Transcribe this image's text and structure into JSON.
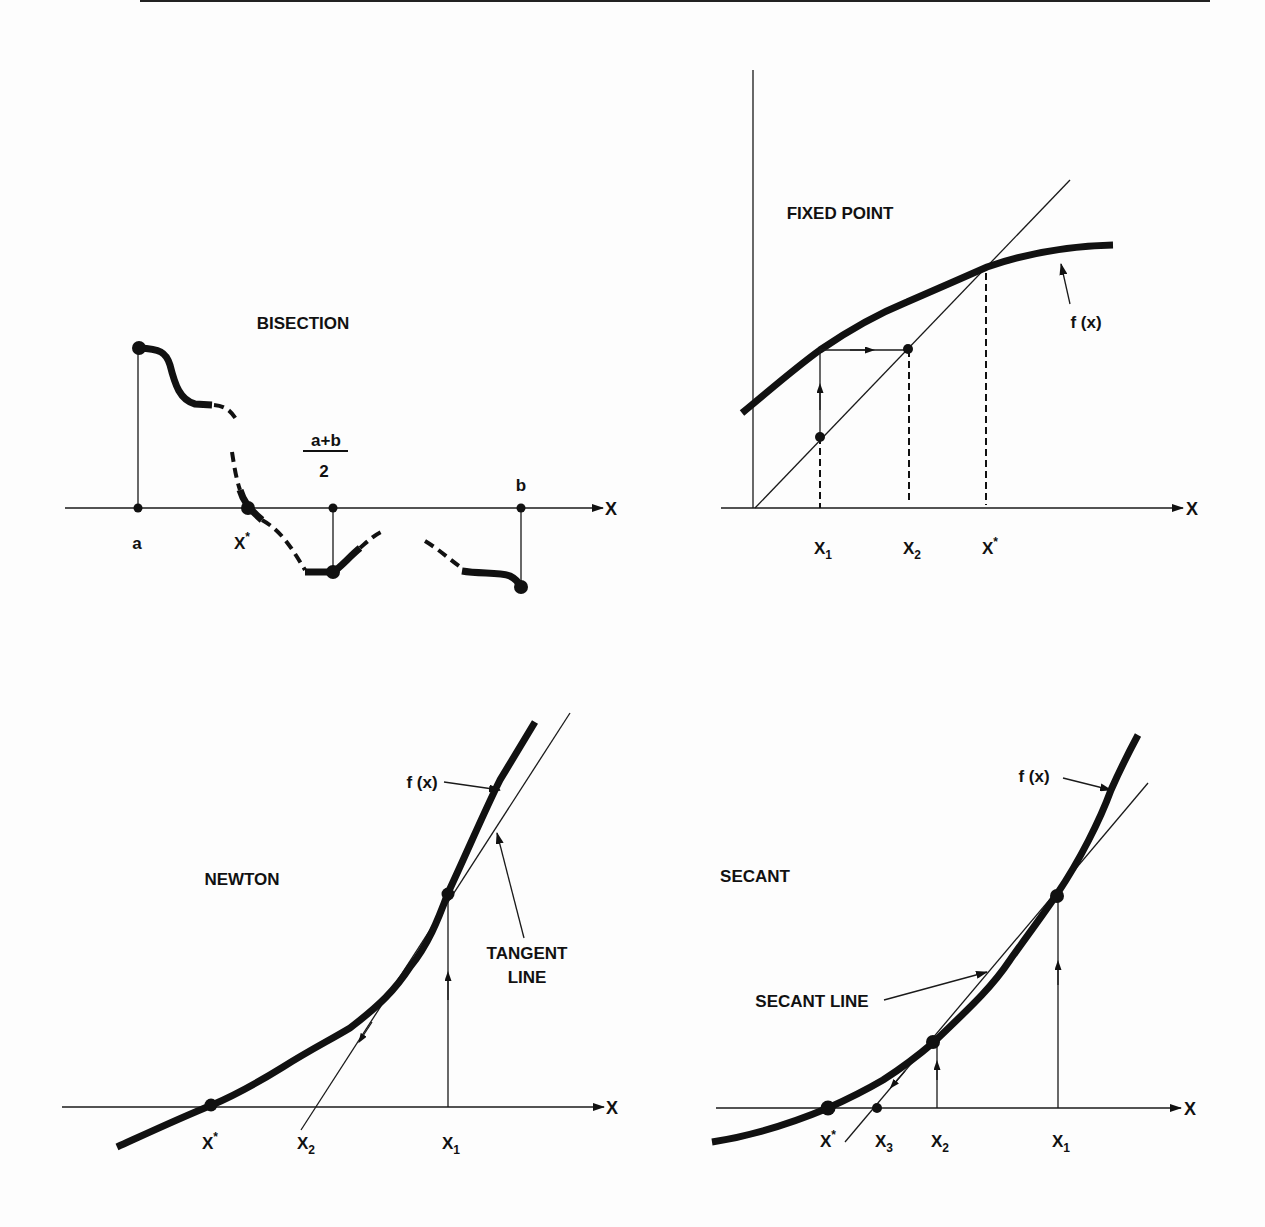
{
  "page": {
    "background": "#fdfdfd",
    "ink": "#111111"
  },
  "panels": {
    "bisection": {
      "title": "BISECTION",
      "axis_label": "X",
      "labels": {
        "a": "a",
        "root": "X",
        "root_sup": "*",
        "midpoint_num": "a+b",
        "midpoint_den": "2",
        "b": "b"
      }
    },
    "fixed_point": {
      "title": "FIXED POINT",
      "axis_label": "X",
      "curve_label": "f (x)",
      "labels": {
        "x1": "X",
        "x1_sub": "1",
        "x2": "X",
        "x2_sub": "2",
        "root": "X",
        "root_sup": "*"
      }
    },
    "newton": {
      "title": "NEWTON",
      "axis_label": "X",
      "curve_label": "f (x)",
      "tangent_label_line1": "TANGENT",
      "tangent_label_line2": "LINE",
      "labels": {
        "root": "X",
        "root_sup": "*",
        "x2": "X",
        "x2_sub": "2",
        "x1": "X",
        "x1_sub": "1"
      }
    },
    "secant": {
      "title": "SECANT",
      "axis_label": "X",
      "curve_label": "f (x)",
      "secant_label": "SECANT LINE",
      "labels": {
        "root": "X",
        "root_sup": "*",
        "x3": "X",
        "x3_sub": "3",
        "x2": "X",
        "x2_sub": "2",
        "x1": "X",
        "x1_sub": "1"
      }
    }
  }
}
